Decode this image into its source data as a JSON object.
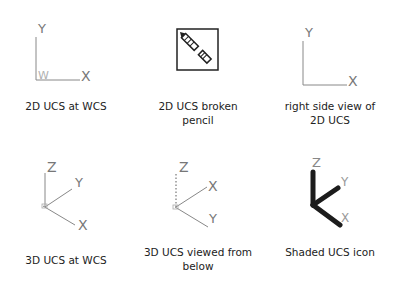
{
  "icons": [
    {
      "id": "2d-ucs-wcs",
      "caption": "2D UCS at WCS",
      "labels": {
        "x": "X",
        "y": "Y",
        "w": "W"
      }
    },
    {
      "id": "2d-ucs-broken-pencil",
      "caption_line1": "2D UCS broken",
      "caption_line2": "pencil"
    },
    {
      "id": "right-side-view-2d",
      "caption_line1": "right side view of",
      "caption_line2": "2D UCS",
      "labels": {
        "x": "X",
        "y": "Y"
      }
    },
    {
      "id": "3d-ucs-wcs",
      "caption": "3D UCS at WCS",
      "labels": {
        "x": "X",
        "y": "Y",
        "z": "Z"
      }
    },
    {
      "id": "3d-ucs-below",
      "caption_line1": "3D UCS viewed from",
      "caption_line2": "below",
      "labels": {
        "x": "X",
        "y": "Y",
        "z": "Z"
      }
    },
    {
      "id": "shaded-ucs",
      "caption": "Shaded UCS icon",
      "labels": {
        "x": "X",
        "y": "Y",
        "z": "Z"
      }
    }
  ],
  "colors": {
    "line": "#7a7a7a",
    "text": "#222222",
    "shaded": "#1c1c1c",
    "w_label": "#b0b0b0"
  }
}
